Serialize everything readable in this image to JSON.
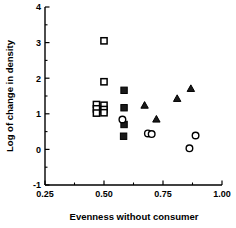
{
  "chart_data": {
    "type": "scatter",
    "title": "",
    "xlabel": "Evenness without consumer",
    "ylabel": "Log of change in density",
    "xlim": [
      0.25,
      1.0
    ],
    "ylim": [
      -1,
      4
    ],
    "xticks": [
      "0.25",
      "0.50",
      "0.75",
      "1.00"
    ],
    "xtick_values": [
      0.25,
      0.5,
      0.75,
      1.0
    ],
    "yticks": [
      "-1",
      "0",
      "1",
      "2",
      "3",
      "4"
    ],
    "ytick_values": [
      -1,
      0,
      1,
      2,
      3,
      4
    ],
    "grid": false,
    "legend": "none",
    "minor_ticks": true,
    "series": [
      {
        "name": "open-square",
        "marker": "open-square",
        "points": [
          {
            "x": 0.5,
            "y": 3.05
          },
          {
            "x": 0.5,
            "y": 1.9
          },
          {
            "x": 0.468,
            "y": 1.26
          },
          {
            "x": 0.468,
            "y": 1.14
          },
          {
            "x": 0.468,
            "y": 1.02
          },
          {
            "x": 0.5,
            "y": 1.24
          },
          {
            "x": 0.5,
            "y": 1.12
          },
          {
            "x": 0.5,
            "y": 1.03
          }
        ]
      },
      {
        "name": "filled-square",
        "marker": "filled-square",
        "points": [
          {
            "x": 0.585,
            "y": 1.66
          },
          {
            "x": 0.585,
            "y": 1.17
          },
          {
            "x": 0.585,
            "y": 0.7
          },
          {
            "x": 0.583,
            "y": 0.37
          }
        ]
      },
      {
        "name": "filled-triangle",
        "marker": "filled-triangle",
        "points": [
          {
            "x": 0.672,
            "y": 1.25
          },
          {
            "x": 0.722,
            "y": 0.86
          },
          {
            "x": 0.81,
            "y": 1.44
          },
          {
            "x": 0.868,
            "y": 1.72
          }
        ]
      },
      {
        "name": "open-circle",
        "marker": "open-circle",
        "points": [
          {
            "x": 0.578,
            "y": 0.84
          },
          {
            "x": 0.686,
            "y": 0.45
          },
          {
            "x": 0.702,
            "y": 0.43
          },
          {
            "x": 0.862,
            "y": 0.03
          },
          {
            "x": 0.888,
            "y": 0.39
          }
        ]
      }
    ]
  },
  "colors": {
    "axis": "#000000",
    "marker_fill": "#1a1a1a",
    "marker_stroke": "#000000",
    "background": "#ffffff"
  }
}
